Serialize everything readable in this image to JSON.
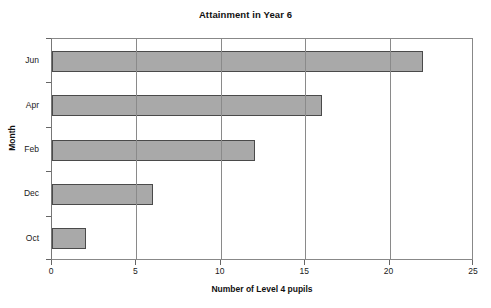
{
  "chart_data": {
    "type": "bar",
    "orientation": "horizontal",
    "title": "Attainment in Year 6",
    "xlabel": "Number of Level 4 pupils",
    "ylabel": "Month",
    "categories": [
      "Oct",
      "Dec",
      "Feb",
      "Apr",
      "Jun"
    ],
    "values": [
      2,
      6,
      12,
      16,
      22
    ],
    "xticks": [
      0,
      5,
      10,
      15,
      20,
      25
    ],
    "xlim": [
      0,
      25
    ],
    "grid": "vertical",
    "legend": "none",
    "bar_fill_color": "#a9a9a9",
    "bar_border_color": "#4a4a4a",
    "axis_color": "#888888",
    "gridline_color": "#8a8a8a",
    "background_color": "#ffffff"
  },
  "axis": {
    "x_tick_labels": [
      "0",
      "5",
      "10",
      "15",
      "20",
      "25"
    ],
    "y_tick_labels_top_to_bottom": [
      "Jun",
      "Apr",
      "Feb",
      "Dec",
      "Oct"
    ]
  }
}
